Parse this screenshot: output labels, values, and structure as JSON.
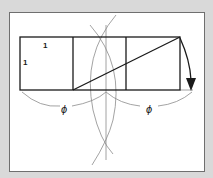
{
  "diagram": {
    "labels": {
      "top_side": "1",
      "left_side": "1",
      "phi_left": "ϕ",
      "phi_right": "ϕ"
    },
    "colors": {
      "background": "#d9d9d9",
      "panel": "#ffffff",
      "line": "#1a1a1a",
      "construction": "#8c8c8c"
    }
  }
}
